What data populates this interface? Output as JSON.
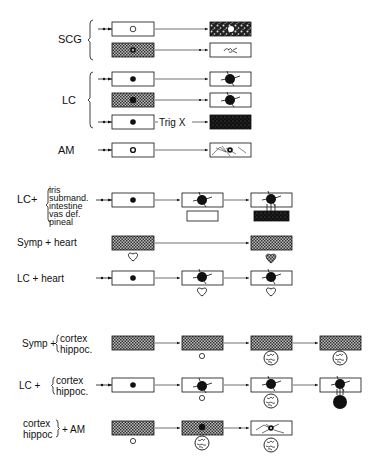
{
  "figure": {
    "type": "schematic diagram of tissue co-culture / transplant outcomes",
    "section1": {
      "groups": [
        {
          "label": "SCG",
          "rows": 2
        },
        {
          "label": "LC",
          "rows": 3,
          "annotation": "Trig X"
        },
        {
          "label": "AM",
          "rows": 1
        }
      ]
    },
    "section2": {
      "rows": [
        {
          "label": "LC+",
          "targets": [
            "iris",
            "submand.",
            "intestine",
            "vas def.",
            "pineal"
          ]
        },
        {
          "label": "Symp + heart"
        },
        {
          "label": "LC + heart"
        }
      ]
    },
    "section3": {
      "rows": [
        {
          "label": "Symp +",
          "targets": [
            "cortex",
            "hippoc."
          ]
        },
        {
          "label": "LC +",
          "targets": [
            "cortex",
            "hippoc."
          ]
        },
        {
          "label": "+ AM",
          "targets": [
            "cortex",
            "hippoc."
          ]
        }
      ]
    }
  },
  "labels": {
    "scg": "SCG",
    "lc": "LC",
    "trig": "Trig X",
    "am": "AM",
    "lcplus": "LC+",
    "iris": "iris",
    "submand": "submand.",
    "intestine": "intestine",
    "vasdef": "vas def.",
    "pineal": "pineal",
    "symp_heart": "Symp + heart",
    "lc_heart": "LC + heart",
    "symp_plus": "Symp +",
    "cortex": "cortex",
    "hippoc": "hippoc.",
    "lc_plus2": "LC +",
    "cortex2": "cortex",
    "hippoc2": "hippoc",
    "plus_am": "+ AM"
  },
  "colors": {
    "ink": "#111111",
    "hatch_fill": "#555555",
    "background": "#ffffff"
  }
}
